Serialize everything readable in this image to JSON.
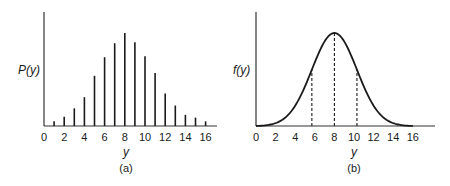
{
  "chart_data": [
    {
      "panel": "(a)",
      "type": "bar",
      "style": "stem",
      "title": "",
      "xlabel": "y",
      "ylabel": "P(y)",
      "x": [
        1,
        2,
        3,
        4,
        5,
        6,
        7,
        8,
        9,
        10,
        11,
        12,
        13,
        14,
        15,
        16
      ],
      "values": [
        0.05,
        0.1,
        0.19,
        0.31,
        0.54,
        0.74,
        0.89,
        1.0,
        0.9,
        0.75,
        0.57,
        0.35,
        0.22,
        0.12,
        0.09,
        0.05
      ],
      "xticks": [
        "0",
        "2",
        "4",
        "6",
        "8",
        "10",
        "12",
        "14",
        "16"
      ],
      "xlim": [
        0,
        17
      ],
      "ylim": [
        0,
        1.2
      ],
      "grid": false,
      "legend": null,
      "caption": "(a)"
    },
    {
      "panel": "(b)",
      "type": "line",
      "title": "",
      "xlabel": "y",
      "ylabel": "f(y)",
      "series": [
        {
          "name": "f(y)",
          "x": [
            0,
            2,
            4,
            5.7,
            6,
            8,
            10,
            10.3,
            12,
            14,
            16
          ],
          "values": [
            0.0,
            0.08,
            0.3,
            0.74,
            0.78,
            1.0,
            0.78,
            0.74,
            0.3,
            0.08,
            0.0
          ]
        }
      ],
      "dashed_verticals": [
        5.7,
        8,
        10.3
      ],
      "xticks": [
        "0",
        "2",
        "4",
        "6",
        "8",
        "10",
        "12",
        "14",
        "16"
      ],
      "xlim": [
        0,
        18
      ],
      "ylim": [
        0,
        1.2
      ],
      "grid": false,
      "legend": null,
      "caption": "(b)"
    }
  ],
  "panels": {
    "a": {
      "ylabel": "P(y)",
      "xlabel": "y",
      "caption": "(a)"
    },
    "b": {
      "ylabel": "f(y)",
      "xlabel": "y",
      "caption": "(b)"
    }
  }
}
